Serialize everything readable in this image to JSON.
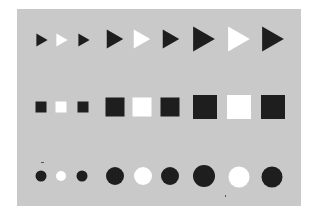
{
  "canvas": {
    "width": 315,
    "height": 217,
    "background": "#ffffff",
    "panel": {
      "x": 17,
      "y": 9,
      "width": 284,
      "height": 197,
      "color": "#c9c9c9"
    }
  },
  "colors": {
    "dark": "#1e1e1e",
    "light": "#ffffff"
  },
  "rows": [
    {
      "shape": "triangle",
      "items": [
        {
          "cx": 42,
          "cy": 40,
          "size": 13,
          "fill": "dark"
        },
        {
          "cx": 62,
          "cy": 40,
          "size": 13,
          "fill": "light"
        },
        {
          "cx": 84,
          "cy": 40,
          "size": 13,
          "fill": "dark"
        },
        {
          "cx": 115,
          "cy": 39,
          "size": 19,
          "fill": "dark"
        },
        {
          "cx": 142,
          "cy": 39,
          "size": 19,
          "fill": "light"
        },
        {
          "cx": 171,
          "cy": 39,
          "size": 19,
          "fill": "dark"
        },
        {
          "cx": 204,
          "cy": 39,
          "size": 25,
          "fill": "dark"
        },
        {
          "cx": 239,
          "cy": 39,
          "size": 25,
          "fill": "light"
        },
        {
          "cx": 273,
          "cy": 39,
          "size": 25,
          "fill": "dark"
        }
      ]
    },
    {
      "shape": "square",
      "items": [
        {
          "cx": 41,
          "cy": 107,
          "size": 11,
          "fill": "dark"
        },
        {
          "cx": 61,
          "cy": 107,
          "size": 11,
          "fill": "light"
        },
        {
          "cx": 83,
          "cy": 107,
          "size": 11,
          "fill": "dark"
        },
        {
          "cx": 115,
          "cy": 107,
          "size": 19,
          "fill": "dark"
        },
        {
          "cx": 142,
          "cy": 107,
          "size": 19,
          "fill": "light"
        },
        {
          "cx": 170,
          "cy": 107,
          "size": 19,
          "fill": "dark"
        },
        {
          "cx": 205,
          "cy": 107,
          "size": 24,
          "fill": "dark"
        },
        {
          "cx": 239,
          "cy": 107,
          "size": 24,
          "fill": "light"
        },
        {
          "cx": 273,
          "cy": 107,
          "size": 24,
          "fill": "dark"
        }
      ]
    },
    {
      "shape": "circle",
      "items": [
        {
          "cx": 41,
          "cy": 176,
          "size": 11,
          "fill": "dark"
        },
        {
          "cx": 61,
          "cy": 176,
          "size": 10,
          "fill": "light"
        },
        {
          "cx": 82,
          "cy": 176,
          "size": 11,
          "fill": "dark"
        },
        {
          "cx": 115,
          "cy": 176,
          "size": 18,
          "fill": "dark"
        },
        {
          "cx": 143,
          "cy": 176,
          "size": 18,
          "fill": "light"
        },
        {
          "cx": 170,
          "cy": 176,
          "size": 18,
          "fill": "dark"
        },
        {
          "cx": 204,
          "cy": 176,
          "size": 22,
          "fill": "dark"
        },
        {
          "cx": 239,
          "cy": 177,
          "size": 21,
          "fill": "light"
        },
        {
          "cx": 272,
          "cy": 177,
          "size": 21,
          "fill": "dark"
        }
      ]
    }
  ],
  "specks": [
    {
      "x": 41,
      "y": 162,
      "w": 3,
      "h": 1
    },
    {
      "x": 225,
      "y": 195,
      "w": 1,
      "h": 2
    }
  ]
}
